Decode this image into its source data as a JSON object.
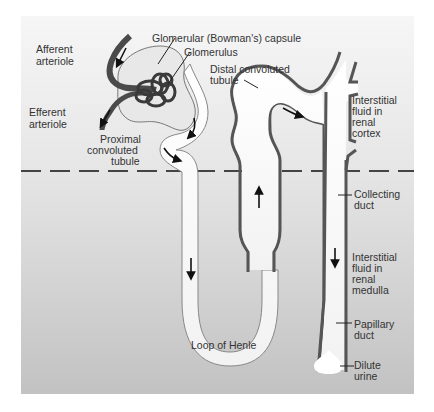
{
  "figure": {
    "colors": {
      "panel_top": "#f4f4f4",
      "panel_bottom": "#c4c4c4",
      "tubule_wall": "#555555",
      "arteriole": "#4a4a4a",
      "lumen": "#fafafa",
      "boundary_dash": "#444444"
    }
  },
  "labels": {
    "capsule": "Glomerular (Bowman's) capsule",
    "glomerulus": "Glomerulus",
    "afferent_1": "Afferent",
    "afferent_2": "arteriole",
    "efferent_1": "Efferent",
    "efferent_2": "arteriole",
    "proximal_1": "Proximal",
    "proximal_2": "convoluted",
    "proximal_3": "tubule",
    "distal_1": "Distal convoluted",
    "distal_2": "tubule",
    "cortex_1": "Interstitial",
    "cortex_2": "fluid in",
    "cortex_3": "renal",
    "cortex_4": "cortex",
    "collecting_1": "Collecting",
    "collecting_2": "duct",
    "medulla_1": "Interstitial",
    "medulla_2": "fluid in",
    "medulla_3": "renal",
    "medulla_4": "medulla",
    "papillary_1": "Papillary",
    "papillary_2": "duct",
    "loop": "Loop of Henle",
    "urine_1": "Dilute",
    "urine_2": "urine"
  },
  "regions": [
    "renal cortex",
    "renal medulla"
  ],
  "flow_arrows": [
    "afferent-in",
    "efferent-out",
    "proximal-1",
    "proximal-2",
    "descending-limb",
    "ascending-limb",
    "distal-to-collecting",
    "collecting-duct-down"
  ]
}
